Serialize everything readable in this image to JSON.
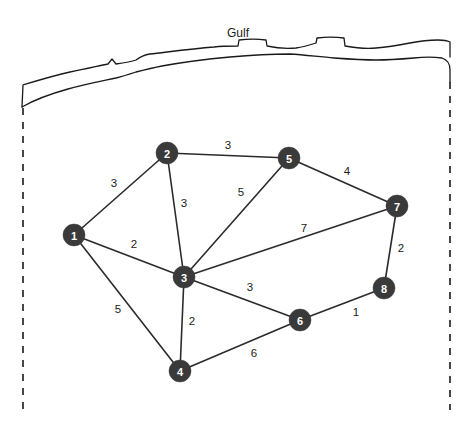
{
  "figure": {
    "title_label": "Gulf",
    "background_color": "#ffffff",
    "ink_color": "#1a1a1a",
    "node_color": "#3a3a3a",
    "node_text_color": "#ffffff"
  },
  "chart_data": {
    "type": "diagram",
    "subtype": "weighted-undirected-graph-on-map",
    "title": "Gulf",
    "xlabel": "",
    "ylabel": "",
    "grid": false,
    "legend": "none",
    "nodes": [
      {
        "id": "1",
        "label": "1",
        "x": 74,
        "y": 235
      },
      {
        "id": "2",
        "label": "2",
        "x": 167,
        "y": 153
      },
      {
        "id": "3",
        "label": "3",
        "x": 184,
        "y": 277
      },
      {
        "id": "4",
        "label": "4",
        "x": 180,
        "y": 371
      },
      {
        "id": "5",
        "label": "5",
        "x": 289,
        "y": 158
      },
      {
        "id": "6",
        "label": "6",
        "x": 300,
        "y": 320
      },
      {
        "id": "7",
        "label": "7",
        "x": 397,
        "y": 206
      },
      {
        "id": "8",
        "label": "8",
        "x": 384,
        "y": 288
      }
    ],
    "node_radius": 11,
    "edges": [
      {
        "source": "1",
        "target": "2",
        "weight": 3,
        "label": "3",
        "lx": 114,
        "ly": 184
      },
      {
        "source": "2",
        "target": "5",
        "weight": 3,
        "label": "3",
        "lx": 228,
        "ly": 146
      },
      {
        "source": "2",
        "target": "3",
        "weight": 3,
        "label": "3",
        "lx": 184,
        "ly": 204
      },
      {
        "source": "5",
        "target": "7",
        "weight": 4,
        "label": "4",
        "lx": 347,
        "ly": 172
      },
      {
        "source": "3",
        "target": "5",
        "weight": 5,
        "label": "5",
        "lx": 241,
        "ly": 193
      },
      {
        "source": "1",
        "target": "3",
        "weight": 2,
        "label": "2",
        "lx": 134,
        "ly": 245
      },
      {
        "source": "3",
        "target": "7",
        "weight": 7,
        "label": "7",
        "lx": 304,
        "ly": 229
      },
      {
        "source": "7",
        "target": "8",
        "weight": 2,
        "label": "2",
        "lx": 401,
        "ly": 249
      },
      {
        "source": "1",
        "target": "4",
        "weight": 5,
        "label": "5",
        "lx": 118,
        "ly": 310
      },
      {
        "source": "3",
        "target": "6",
        "weight": 3,
        "label": "3",
        "lx": 250,
        "ly": 288
      },
      {
        "source": "3",
        "target": "4",
        "weight": 2,
        "label": "2",
        "lx": 192,
        "ly": 322
      },
      {
        "source": "6",
        "target": "8",
        "weight": 1,
        "label": "1",
        "lx": 356,
        "ly": 313
      },
      {
        "source": "4",
        "target": "6",
        "weight": 6,
        "label": "6",
        "lx": 254,
        "ly": 354
      }
    ],
    "annotations": [
      {
        "name": "gulf-label",
        "text": "Gulf",
        "x": 238,
        "y": 33
      }
    ],
    "boundaries": [
      {
        "name": "left-border",
        "style": "dashed",
        "x": 23,
        "y1": 108,
        "y2": 410
      },
      {
        "name": "right-border",
        "style": "dashed",
        "x": 450,
        "y1": 82,
        "y2": 410
      }
    ]
  }
}
